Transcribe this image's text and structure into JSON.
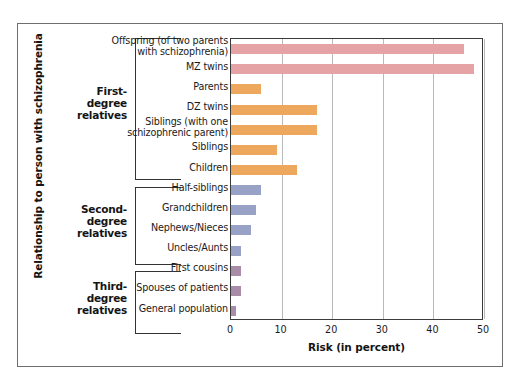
{
  "chart_data": {
    "type": "bar",
    "orientation": "horizontal",
    "title": "",
    "xlabel": "Risk (in percent)",
    "ylabel": "Relationship to person with schizophrenia",
    "xlim": [
      0,
      50
    ],
    "xticks": [
      0,
      10,
      20,
      30,
      40,
      50
    ],
    "xtick_labels": [
      "0",
      "10",
      "20",
      "30",
      "40",
      "50"
    ],
    "grid": "vertical gridlines at each x tick",
    "legend": "none",
    "categories": [
      "Offspring (of two parents with schizophrenia)",
      "MZ twins",
      "Parents",
      "DZ twins",
      "Siblings (with one schizophrenic parent)",
      "Siblings",
      "Children",
      "Half-siblings",
      "Grandchildren",
      "Nephews/Nieces",
      "Uncles/Aunts",
      "First cousins",
      "Spouses  of patients",
      "General population"
    ],
    "values": [
      46,
      48,
      6,
      17,
      17,
      9,
      13,
      6,
      5,
      4,
      2,
      2,
      2,
      1
    ],
    "bars": [
      {
        "label_line1": "Offspring (of two parents",
        "label_line2": "with schizophrenia)",
        "value": 46,
        "color": "#e6a3a5",
        "group": "First-degree relatives"
      },
      {
        "label_line1": "MZ twins",
        "label_line2": "",
        "value": 48,
        "color": "#e6a3a5",
        "group": "First-degree relatives"
      },
      {
        "label_line1": "Parents",
        "label_line2": "",
        "value": 6,
        "color": "#eda85e",
        "group": "First-degree relatives"
      },
      {
        "label_line1": "DZ twins",
        "label_line2": "",
        "value": 17,
        "color": "#eda85e",
        "group": "First-degree relatives"
      },
      {
        "label_line1": "Siblings (with one",
        "label_line2": "schizophrenic parent)",
        "value": 17,
        "color": "#eda85e",
        "group": "First-degree relatives"
      },
      {
        "label_line1": "Siblings",
        "label_line2": "",
        "value": 9,
        "color": "#eda85e",
        "group": "First-degree relatives"
      },
      {
        "label_line1": "Children",
        "label_line2": "",
        "value": 13,
        "color": "#eda85e",
        "group": "First-degree relatives"
      },
      {
        "label_line1": "Half-siblings",
        "label_line2": "",
        "value": 6,
        "color": "#98a2c6",
        "group": "Second-degree relatives"
      },
      {
        "label_line1": "Grandchildren",
        "label_line2": "",
        "value": 5,
        "color": "#98a2c6",
        "group": "Second-degree relatives"
      },
      {
        "label_line1": "Nephews/Nieces",
        "label_line2": "",
        "value": 4,
        "color": "#98a2c6",
        "group": "Second-degree relatives"
      },
      {
        "label_line1": "Uncles/Aunts",
        "label_line2": "",
        "value": 2,
        "color": "#98a2c6",
        "group": "Second-degree relatives"
      },
      {
        "label_line1": "First cousins",
        "label_line2": "",
        "value": 2,
        "color": "#a98ca8",
        "group": "Third-degree relatives"
      },
      {
        "label_line1": "Spouses  of patients",
        "label_line2": "",
        "value": 2,
        "color": "#a98ca8",
        "group": "Third-degree relatives"
      },
      {
        "label_line1": "General population",
        "label_line2": "",
        "value": 1,
        "color": "#a98ca8",
        "group": "Third-degree relatives"
      }
    ],
    "groups": [
      {
        "line1": "First-",
        "line2": "degree",
        "line3": "relatives"
      },
      {
        "line1": "Second-",
        "line2": "degree",
        "line3": "relatives"
      },
      {
        "line1": "Third-",
        "line2": "degree",
        "line3": "relatives"
      }
    ],
    "colors": {
      "pink": "#e6a3a5",
      "orange": "#eda85e",
      "blue": "#98a2c6",
      "purple": "#a98ca8",
      "frame": "#6e6e6e",
      "axis": "#3a3a3a",
      "grid": "#b9b9b9",
      "text": "#141414",
      "background": "#ffffff"
    }
  }
}
